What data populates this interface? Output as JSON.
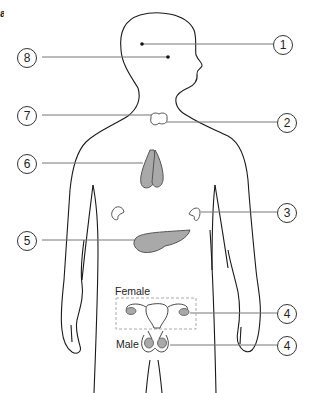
{
  "figure": {
    "panel_letter": "a",
    "colors": {
      "outline": "#1a1a1a",
      "leader": "#777777",
      "organ_fill": "#a9a9a9",
      "organ_light": "#ffffff"
    }
  },
  "labels": [
    {
      "id": "1",
      "number": "1",
      "side": "right",
      "target": "brain-dot-front"
    },
    {
      "id": "2",
      "number": "2",
      "side": "right",
      "target": "thyroid"
    },
    {
      "id": "3",
      "number": "3",
      "side": "right",
      "target": "adrenal-right"
    },
    {
      "id": "4a",
      "number": "4",
      "side": "right",
      "target": "ovary"
    },
    {
      "id": "4b",
      "number": "4",
      "side": "right",
      "target": "testis"
    },
    {
      "id": "5",
      "number": "5",
      "side": "left",
      "target": "pancreas"
    },
    {
      "id": "6",
      "number": "6",
      "side": "left",
      "target": "thymus"
    },
    {
      "id": "7",
      "number": "7",
      "side": "left",
      "target": "thyroid"
    },
    {
      "id": "8",
      "number": "8",
      "side": "left",
      "target": "brain-dot-back"
    }
  ],
  "text": {
    "female": "Female",
    "male": "Male"
  }
}
